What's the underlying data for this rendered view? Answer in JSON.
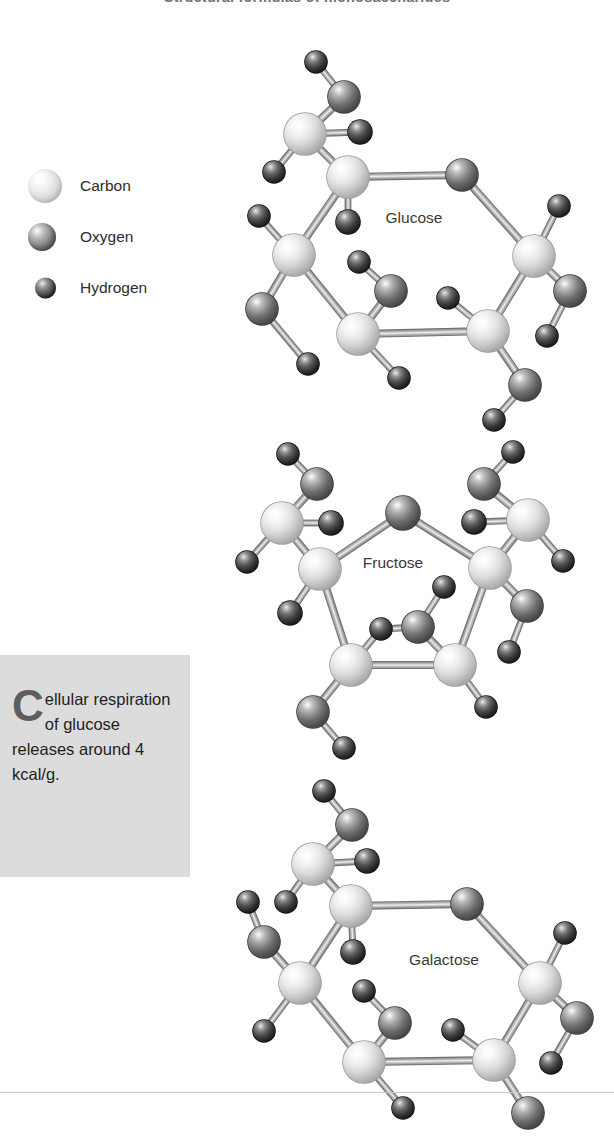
{
  "page": {
    "title": "Structural formulas of monosaccharides",
    "background_color": "#ffffff",
    "footer_rule_color": "#c8c8c8"
  },
  "legend": {
    "items": [
      {
        "label": "Carbon",
        "symbol": "C",
        "kind": "carbon",
        "radius": 17,
        "color": "#e8e8e8"
      },
      {
        "label": "Oxygen",
        "symbol": "O",
        "kind": "oxygen",
        "radius": 14,
        "color": "#777777"
      },
      {
        "label": "Hydrogen",
        "symbol": "H",
        "kind": "hydrogen",
        "radius": 10,
        "color": "#2e2e2e"
      }
    ]
  },
  "callout": {
    "dropcap": "C",
    "text": "ellular respiration of glucose releases around 4 kcal/g.",
    "full_text": "Cellular respiration of glucose releases around 4 kcal/g.",
    "background_color": "#dcdcdc",
    "dropcap_color": "#5e5e5e"
  },
  "molecules": [
    {
      "name": "Glucose",
      "label_x": 414,
      "label_y": 218,
      "ring_type": "pyranose",
      "ring_size": 6,
      "atoms": [
        {
          "id": "C1",
          "kind": "carbon",
          "x": 348,
          "y": 177,
          "r": 21
        },
        {
          "id": "O5",
          "kind": "oxygen",
          "x": 462,
          "y": 175,
          "r": 16
        },
        {
          "id": "C5",
          "kind": "carbon",
          "x": 534,
          "y": 256,
          "r": 21
        },
        {
          "id": "C4",
          "kind": "carbon",
          "x": 488,
          "y": 331,
          "r": 21
        },
        {
          "id": "C3",
          "kind": "carbon",
          "x": 358,
          "y": 334,
          "r": 21
        },
        {
          "id": "C2",
          "kind": "carbon",
          "x": 294,
          "y": 255,
          "r": 21
        },
        {
          "id": "C6",
          "kind": "carbon",
          "x": 305,
          "y": 134,
          "r": 21
        },
        {
          "id": "O6",
          "kind": "oxygen",
          "x": 344,
          "y": 97,
          "r": 16
        },
        {
          "id": "H6a",
          "kind": "hydrogen",
          "x": 316,
          "y": 62,
          "r": 11
        },
        {
          "id": "H6b",
          "kind": "hydrogen",
          "x": 360,
          "y": 132,
          "r": 12
        },
        {
          "id": "H2a",
          "kind": "hydrogen",
          "x": 274,
          "y": 172,
          "r": 11
        },
        {
          "id": "H1",
          "kind": "hydrogen",
          "x": 348,
          "y": 222,
          "r": 12
        },
        {
          "id": "H2b",
          "kind": "hydrogen",
          "x": 259,
          "y": 216,
          "r": 11
        },
        {
          "id": "O2",
          "kind": "oxygen",
          "x": 262,
          "y": 309,
          "r": 16
        },
        {
          "id": "H2c",
          "kind": "hydrogen",
          "x": 308,
          "y": 364,
          "r": 11
        },
        {
          "id": "O3",
          "kind": "oxygen",
          "x": 391,
          "y": 291,
          "r": 16
        },
        {
          "id": "H3a",
          "kind": "hydrogen",
          "x": 359,
          "y": 262,
          "r": 11
        },
        {
          "id": "H3b",
          "kind": "hydrogen",
          "x": 399,
          "y": 378,
          "r": 11
        },
        {
          "id": "H4",
          "kind": "hydrogen",
          "x": 448,
          "y": 298,
          "r": 11
        },
        {
          "id": "O4",
          "kind": "oxygen",
          "x": 525,
          "y": 385,
          "r": 16
        },
        {
          "id": "H4b",
          "kind": "hydrogen",
          "x": 494,
          "y": 420,
          "r": 11
        },
        {
          "id": "H5a",
          "kind": "hydrogen",
          "x": 559,
          "y": 206,
          "r": 11
        },
        {
          "id": "O5b",
          "kind": "oxygen",
          "x": 570,
          "y": 291,
          "r": 16
        },
        {
          "id": "H5b",
          "kind": "hydrogen",
          "x": 547,
          "y": 336,
          "r": 11
        }
      ],
      "bonds": [
        [
          "C1",
          "O5"
        ],
        [
          "O5",
          "C5"
        ],
        [
          "C5",
          "C4"
        ],
        [
          "C4",
          "C3"
        ],
        [
          "C3",
          "C2"
        ],
        [
          "C2",
          "C1"
        ],
        [
          "C1",
          "C6"
        ],
        [
          "C6",
          "O6"
        ],
        [
          "O6",
          "H6a"
        ],
        [
          "C6",
          "H6b"
        ],
        [
          "C6",
          "H2a"
        ],
        [
          "C1",
          "H1"
        ],
        [
          "C2",
          "H2b"
        ],
        [
          "C2",
          "O2"
        ],
        [
          "O2",
          "H2c"
        ],
        [
          "C3",
          "O3"
        ],
        [
          "O3",
          "H3a"
        ],
        [
          "C3",
          "H3b"
        ],
        [
          "C4",
          "H4"
        ],
        [
          "C4",
          "O4"
        ],
        [
          "O4",
          "H4b"
        ],
        [
          "C5",
          "H5a"
        ],
        [
          "C5",
          "O5b"
        ],
        [
          "O5b",
          "H5b"
        ]
      ]
    },
    {
      "name": "Fructose",
      "label_x": 393,
      "label_y": 563,
      "ring_type": "furanose",
      "ring_size": 5,
      "atoms": [
        {
          "id": "O5",
          "kind": "oxygen",
          "x": 403,
          "y": 513,
          "r": 17
        },
        {
          "id": "C2",
          "kind": "carbon",
          "x": 320,
          "y": 569,
          "r": 21
        },
        {
          "id": "C5",
          "kind": "carbon",
          "x": 490,
          "y": 568,
          "r": 21
        },
        {
          "id": "C3",
          "kind": "carbon",
          "x": 351,
          "y": 665,
          "r": 21
        },
        {
          "id": "C4",
          "kind": "carbon",
          "x": 455,
          "y": 665,
          "r": 21
        },
        {
          "id": "C1",
          "kind": "carbon",
          "x": 282,
          "y": 523,
          "r": 21
        },
        {
          "id": "O1",
          "kind": "oxygen",
          "x": 317,
          "y": 484,
          "r": 16
        },
        {
          "id": "H1a",
          "kind": "hydrogen",
          "x": 288,
          "y": 454,
          "r": 11
        },
        {
          "id": "H1b",
          "kind": "hydrogen",
          "x": 331,
          "y": 523,
          "r": 12
        },
        {
          "id": "H1c",
          "kind": "hydrogen",
          "x": 247,
          "y": 562,
          "r": 11
        },
        {
          "id": "H2",
          "kind": "hydrogen",
          "x": 290,
          "y": 613,
          "r": 12
        },
        {
          "id": "O3",
          "kind": "oxygen",
          "x": 418,
          "y": 627,
          "r": 16
        },
        {
          "id": "H3a",
          "kind": "hydrogen",
          "x": 444,
          "y": 587,
          "r": 11
        },
        {
          "id": "H3b",
          "kind": "hydrogen",
          "x": 381,
          "y": 629,
          "r": 11
        },
        {
          "id": "C6",
          "kind": "oxygen",
          "x": 313,
          "y": 712,
          "r": 16
        },
        {
          "id": "H6",
          "kind": "hydrogen",
          "x": 344,
          "y": 748,
          "r": 11
        },
        {
          "id": "H4",
          "kind": "hydrogen",
          "x": 486,
          "y": 707,
          "r": 11
        },
        {
          "id": "C5b",
          "kind": "oxygen",
          "x": 527,
          "y": 606,
          "r": 16
        },
        {
          "id": "H5b",
          "kind": "hydrogen",
          "x": 509,
          "y": 652,
          "r": 11
        },
        {
          "id": "C6b",
          "kind": "carbon",
          "x": 528,
          "y": 520,
          "r": 21
        },
        {
          "id": "O6b",
          "kind": "oxygen",
          "x": 484,
          "y": 484,
          "r": 16
        },
        {
          "id": "H6a",
          "kind": "hydrogen",
          "x": 513,
          "y": 452,
          "r": 11
        },
        {
          "id": "H6b",
          "kind": "hydrogen",
          "x": 474,
          "y": 522,
          "r": 12
        },
        {
          "id": "H6c",
          "kind": "hydrogen",
          "x": 563,
          "y": 561,
          "r": 11
        }
      ],
      "bonds": [
        [
          "C2",
          "O5"
        ],
        [
          "O5",
          "C5"
        ],
        [
          "C5",
          "C4"
        ],
        [
          "C4",
          "C3"
        ],
        [
          "C3",
          "C2"
        ],
        [
          "C2",
          "C1"
        ],
        [
          "C1",
          "O1"
        ],
        [
          "O1",
          "H1a"
        ],
        [
          "C1",
          "H1b"
        ],
        [
          "C1",
          "H1c"
        ],
        [
          "C2",
          "H2"
        ],
        [
          "C4",
          "O3"
        ],
        [
          "O3",
          "H3a"
        ],
        [
          "O3",
          "H3b"
        ],
        [
          "C3",
          "C6"
        ],
        [
          "C6",
          "H6"
        ],
        [
          "C3",
          "H3b"
        ],
        [
          "C4",
          "H4"
        ],
        [
          "C5",
          "C5b"
        ],
        [
          "C5b",
          "H5b"
        ],
        [
          "C5",
          "C6b"
        ],
        [
          "C6b",
          "O6b"
        ],
        [
          "O6b",
          "H6a"
        ],
        [
          "C6b",
          "H6b"
        ],
        [
          "C6b",
          "H6c"
        ]
      ]
    },
    {
      "name": "Galactose",
      "label_x": 444,
      "label_y": 960,
      "ring_type": "pyranose",
      "ring_size": 6,
      "atoms": [
        {
          "id": "C1",
          "kind": "carbon",
          "x": 351,
          "y": 906,
          "r": 21
        },
        {
          "id": "O5",
          "kind": "oxygen",
          "x": 467,
          "y": 904,
          "r": 16
        },
        {
          "id": "C5",
          "kind": "carbon",
          "x": 540,
          "y": 983,
          "r": 21
        },
        {
          "id": "C4",
          "kind": "carbon",
          "x": 494,
          "y": 1060,
          "r": 21
        },
        {
          "id": "C3",
          "kind": "carbon",
          "x": 364,
          "y": 1062,
          "r": 21
        },
        {
          "id": "C2",
          "kind": "carbon",
          "x": 300,
          "y": 983,
          "r": 21
        },
        {
          "id": "C6",
          "kind": "carbon",
          "x": 313,
          "y": 864,
          "r": 21
        },
        {
          "id": "O6",
          "kind": "oxygen",
          "x": 352,
          "y": 825,
          "r": 16
        },
        {
          "id": "H6a",
          "kind": "hydrogen",
          "x": 324,
          "y": 791,
          "r": 11
        },
        {
          "id": "H6b",
          "kind": "hydrogen",
          "x": 367,
          "y": 861,
          "r": 12
        },
        {
          "id": "H1",
          "kind": "hydrogen",
          "x": 353,
          "y": 952,
          "r": 12
        },
        {
          "id": "O2a",
          "kind": "oxygen",
          "x": 264,
          "y": 942,
          "r": 16
        },
        {
          "id": "H2a",
          "kind": "hydrogen",
          "x": 248,
          "y": 902,
          "r": 11
        },
        {
          "id": "H2b",
          "kind": "hydrogen",
          "x": 286,
          "y": 902,
          "r": 11
        },
        {
          "id": "H2c",
          "kind": "hydrogen",
          "x": 264,
          "y": 1031,
          "r": 11
        },
        {
          "id": "O3",
          "kind": "oxygen",
          "x": 395,
          "y": 1023,
          "r": 16
        },
        {
          "id": "H3a",
          "kind": "hydrogen",
          "x": 364,
          "y": 991,
          "r": 11
        },
        {
          "id": "H3b",
          "kind": "hydrogen",
          "x": 403,
          "y": 1108,
          "r": 11
        },
        {
          "id": "H4",
          "kind": "hydrogen",
          "x": 453,
          "y": 1030,
          "r": 11
        },
        {
          "id": "O4",
          "kind": "oxygen",
          "x": 528,
          "y": 1113,
          "r": 16
        },
        {
          "id": "H5a",
          "kind": "hydrogen",
          "x": 565,
          "y": 933,
          "r": 11
        },
        {
          "id": "O5b",
          "kind": "oxygen",
          "x": 577,
          "y": 1018,
          "r": 16
        },
        {
          "id": "H5b",
          "kind": "hydrogen",
          "x": 551,
          "y": 1063,
          "r": 11
        }
      ],
      "bonds": [
        [
          "C1",
          "O5"
        ],
        [
          "O5",
          "C5"
        ],
        [
          "C5",
          "C4"
        ],
        [
          "C4",
          "C3"
        ],
        [
          "C3",
          "C2"
        ],
        [
          "C2",
          "C1"
        ],
        [
          "C1",
          "C6"
        ],
        [
          "C6",
          "O6"
        ],
        [
          "O6",
          "H6a"
        ],
        [
          "C6",
          "H6b"
        ],
        [
          "C1",
          "H1"
        ],
        [
          "C2",
          "O2a"
        ],
        [
          "O2a",
          "H2a"
        ],
        [
          "C6",
          "H2b"
        ],
        [
          "C2",
          "H2c"
        ],
        [
          "C3",
          "O3"
        ],
        [
          "O3",
          "H3a"
        ],
        [
          "C3",
          "H3b"
        ],
        [
          "C4",
          "H4"
        ],
        [
          "C4",
          "O4"
        ],
        [
          "C5",
          "H5a"
        ],
        [
          "C5",
          "O5b"
        ],
        [
          "O5b",
          "H5b"
        ]
      ]
    }
  ]
}
